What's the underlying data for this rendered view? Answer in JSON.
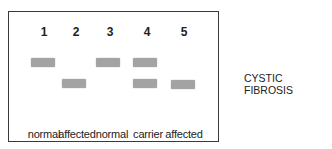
{
  "title": "CYSTIC FIBROSIS",
  "band_color": "#a3a3a3",
  "lanes": [
    {
      "number": "1",
      "label": "normal",
      "bands": [
        "upper"
      ]
    },
    {
      "number": "2",
      "label": "affected",
      "bands": [
        "lower"
      ]
    },
    {
      "number": "3",
      "label": "normal",
      "bands": [
        "upper"
      ]
    },
    {
      "number": "4",
      "label": "carrier",
      "bands": [
        "upper",
        "lower"
      ]
    },
    {
      "number": "5",
      "label": "affected",
      "bands": [
        "lower"
      ]
    }
  ]
}
